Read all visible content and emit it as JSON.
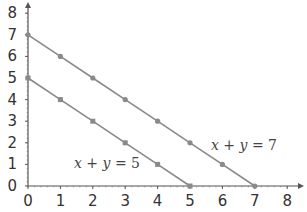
{
  "chart_data": {
    "type": "line",
    "title": "",
    "xlabel": "",
    "ylabel": "",
    "xlim": [
      0,
      8
    ],
    "ylim": [
      0,
      8
    ],
    "x_ticks": [
      0,
      1,
      2,
      3,
      4,
      5,
      6,
      7,
      8
    ],
    "y_ticks": [
      0,
      1,
      2,
      3,
      4,
      5,
      6,
      7,
      8
    ],
    "grid": false,
    "legend": "none",
    "series": [
      {
        "name": "x + y = 7",
        "marker": "circle",
        "x": [
          0,
          1,
          2,
          3,
          4,
          5,
          6,
          7
        ],
        "y": [
          7,
          6,
          5,
          4,
          3,
          2,
          1,
          0
        ]
      },
      {
        "name": "x + y = 5",
        "marker": "square",
        "x": [
          0,
          1,
          2,
          3,
          4,
          5
        ],
        "y": [
          5,
          4,
          3,
          2,
          1,
          0
        ]
      }
    ],
    "annotations": [
      {
        "text": "x + y = 7",
        "x": 6.0,
        "y": 2.0
      },
      {
        "text": "x + y = 5",
        "x": 2.0,
        "y": 1.2
      }
    ]
  },
  "labels": {
    "line7": {
      "a": "x",
      "op": " + ",
      "b": "y",
      "eq": " = ",
      "c": "7"
    },
    "line5": {
      "a": "x",
      "op": " + ",
      "b": "y",
      "eq": " = ",
      "c": "5"
    }
  },
  "colors": {
    "axis": "#555555",
    "line": "#888888",
    "marker": "#8a8a8a"
  }
}
